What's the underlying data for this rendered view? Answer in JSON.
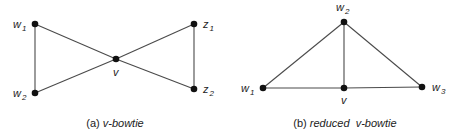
{
  "figures": [
    {
      "id": "a",
      "caption_prefix": "(a) ",
      "caption_italic": "v-bowtie",
      "nodes": [
        {
          "id": "w1",
          "base": "w",
          "sub": "1",
          "x": 35,
          "y": 24
        },
        {
          "id": "w2",
          "base": "w",
          "sub": "2",
          "x": 35,
          "y": 93
        },
        {
          "id": "v",
          "base": "v",
          "sub": "",
          "x": 116,
          "y": 59
        },
        {
          "id": "z1",
          "base": "z",
          "sub": "1",
          "x": 194,
          "y": 24
        },
        {
          "id": "z2",
          "base": "z",
          "sub": "2",
          "x": 194,
          "y": 89
        }
      ],
      "edges": [
        [
          "w1",
          "w2"
        ],
        [
          "w1",
          "v"
        ],
        [
          "w2",
          "v"
        ],
        [
          "v",
          "z1"
        ],
        [
          "v",
          "z2"
        ],
        [
          "z1",
          "z2"
        ]
      ]
    },
    {
      "id": "b",
      "caption_prefix": "(b) ",
      "caption_italic": "reduced  v-bowtie",
      "nodes": [
        {
          "id": "w2",
          "base": "w",
          "sub": "2",
          "x": 344,
          "y": 22
        },
        {
          "id": "w1",
          "base": "w",
          "sub": "1",
          "x": 263,
          "y": 88
        },
        {
          "id": "v",
          "base": "v",
          "sub": "",
          "x": 344,
          "y": 88
        },
        {
          "id": "w3",
          "base": "w",
          "sub": "3",
          "x": 422,
          "y": 87
        }
      ],
      "edges": [
        [
          "w2",
          "w1"
        ],
        [
          "w2",
          "v"
        ],
        [
          "w2",
          "w3"
        ],
        [
          "w1",
          "v"
        ],
        [
          "v",
          "w3"
        ]
      ]
    }
  ],
  "labels": {
    "a_w1_base": "w",
    "a_w1_sub": "1",
    "a_w2_base": "w",
    "a_w2_sub": "2",
    "a_v": "v",
    "a_z1_base": "z",
    "a_z1_sub": "1",
    "a_z2_base": "z",
    "a_z2_sub": "2",
    "b_w2_base": "w",
    "b_w2_sub": "2",
    "b_w1_base": "w",
    "b_w1_sub": "1",
    "b_v": "v",
    "b_w3_base": "w",
    "b_w3_sub": "3"
  },
  "captions": {
    "a_prefix": "(a) ",
    "a_italic": "v-bowtie",
    "b_prefix": "(b) ",
    "b_italic": "reduced  v-bowtie"
  }
}
